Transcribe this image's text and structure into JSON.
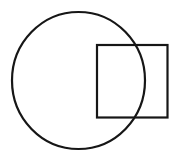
{
  "diagram": {
    "background": "#ffffff",
    "stroke_color": "#161616",
    "stroke_width": 2.2,
    "shapes": [
      {
        "type": "ellipse",
        "name": "circle",
        "cx": 78.5,
        "cy": 80.5,
        "rx": 66.5,
        "ry": 68.5
      },
      {
        "type": "rect",
        "name": "square",
        "x": 97,
        "y": 45,
        "width": 70.5,
        "height": 72.5
      }
    ]
  }
}
